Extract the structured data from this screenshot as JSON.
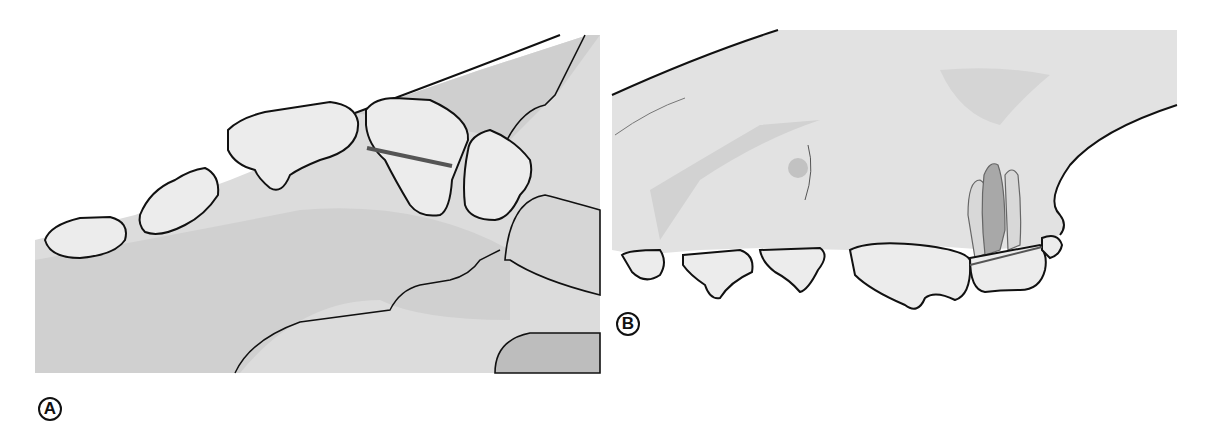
{
  "figure": {
    "panels": [
      {
        "id": "A",
        "label": "A",
        "view": "occlusal/palatal view of upper dental arch",
        "measurement_line": "dark bar across carnassial tooth"
      },
      {
        "id": "B",
        "label": "B",
        "view": "lateral view of maxilla with teeth and root outlines",
        "measurement_line": "line across crown of carnassial tooth with root outlines above"
      }
    ]
  },
  "colors": {
    "outline": "#111111",
    "bone_light": "#e4e4e4",
    "bone_mid": "#d2d2d2",
    "bone_dark": "#bdbdbd",
    "tooth_fill": "#eeeeee",
    "tooth_highlight": "#fafafa",
    "measure_line": "#555555",
    "root_dark": "#a8a8a8"
  }
}
